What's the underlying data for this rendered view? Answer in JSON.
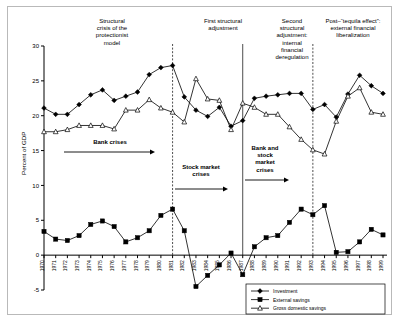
{
  "chart_data": {
    "type": "line",
    "title": "",
    "xlabel": "",
    "ylabel": "Percent of GDP",
    "ylim": [
      -5,
      30
    ],
    "yticks": [
      -5,
      0,
      5,
      10,
      15,
      20,
      25,
      30
    ],
    "ytick_labels": [
      "-5",
      "0",
      "5",
      "10",
      "15",
      "20",
      "25",
      "30"
    ],
    "grid": false,
    "legend_position": "bottom-right",
    "categories": [
      "1970",
      "1971",
      "1972",
      "1973",
      "1974",
      "1975",
      "1976",
      "1977",
      "1978",
      "1979",
      "1980",
      "1981",
      "1982",
      "1983",
      "1984",
      "1985",
      "1986",
      "1987",
      "1988",
      "1989",
      "1990",
      "1991",
      "1992",
      "1993",
      "1994",
      "1995",
      "1996",
      "1997",
      "1998",
      "1999"
    ],
    "series": [
      {
        "name": "Investment",
        "marker": "diamond",
        "values": [
          21.1,
          20.2,
          20.2,
          21.6,
          23.0,
          23.7,
          22.2,
          22.8,
          23.4,
          25.9,
          26.9,
          27.2,
          22.7,
          20.8,
          19.9,
          21.2,
          18.5,
          19.3,
          22.5,
          22.8,
          23.0,
          23.2,
          23.2,
          20.9,
          21.6,
          19.8,
          23.1,
          25.8,
          24.3,
          23.2
        ]
      },
      {
        "name": "External savings",
        "marker": "square",
        "values": [
          3.4,
          2.3,
          2.1,
          2.8,
          4.4,
          4.9,
          4.1,
          1.9,
          2.5,
          3.5,
          5.7,
          6.6,
          3.5,
          -4.5,
          -2.9,
          -1.4,
          0.3,
          -2.8,
          1.2,
          2.5,
          2.8,
          4.7,
          6.6,
          5.8,
          7.1,
          0.4,
          0.5,
          1.9,
          3.7,
          2.9
        ]
      },
      {
        "name": "Gross domestic savings",
        "marker": "triangle",
        "values": [
          17.7,
          17.7,
          18.0,
          18.6,
          18.6,
          18.6,
          18.1,
          20.8,
          20.8,
          22.3,
          21.1,
          20.5,
          19.1,
          25.3,
          22.4,
          22.2,
          18.0,
          21.8,
          21.2,
          20.2,
          20.2,
          18.4,
          16.6,
          15.1,
          14.5,
          19.2,
          22.8,
          24.0,
          20.5,
          20.2
        ]
      }
    ],
    "period_dividers": [
      {
        "after_year": "1981",
        "style": "dashed"
      },
      {
        "after_year": "1987",
        "style": "solid"
      },
      {
        "after_year": "1993",
        "style": "dashed"
      }
    ],
    "period_labels": [
      {
        "text": "Structural\ncrisis of the\nprotectionist\nmodel",
        "center_year": "1975"
      },
      {
        "text": "First structural\nadjustment",
        "center_year": "1984"
      },
      {
        "text": "Second\nstructural\nadjustment:\ninternal\nfinancial\nderegulation",
        "center_year": "1990"
      },
      {
        "text": "Post–“tequila effect”:\nexternal financial\nliberalization",
        "center_year": "1996"
      }
    ],
    "annotations": [
      {
        "text": "Bank crises",
        "bold": true,
        "arrow": "right"
      },
      {
        "text": "Stock market\ncrises",
        "bold": true,
        "arrow": "right"
      },
      {
        "text": "Bank and\nstock\nmarket\ncrises",
        "bold": true,
        "arrow": "right"
      }
    ]
  },
  "chart": {
    "y_axis_title": "Percent of GDP",
    "y_ticks": [
      "30",
      "25",
      "20",
      "15",
      "10",
      "5",
      "0",
      "-5"
    ],
    "x_ticks": [
      "1970",
      "1971",
      "1972",
      "1973",
      "1974",
      "1975",
      "1976",
      "1977",
      "1978",
      "1979",
      "1980",
      "1981",
      "1982",
      "1983",
      "1984",
      "1985",
      "1986",
      "1987",
      "1988",
      "1989",
      "1990",
      "1991",
      "1992",
      "1993",
      "1994",
      "1995",
      "1996",
      "1997",
      "1998",
      "1999"
    ],
    "legend": {
      "items": [
        {
          "label": "Investment"
        },
        {
          "label": "External savings"
        },
        {
          "label": "Gross domestic savings"
        }
      ]
    },
    "period_headers": {
      "p1_l1": "Structural",
      "p1_l2": "crisis of the",
      "p1_l3": "protectionist",
      "p1_l4": "model",
      "p2_l1": "First structural",
      "p2_l2": "adjustment",
      "p3_l1": "Second",
      "p3_l2": "structural",
      "p3_l3": "adjustment:",
      "p3_l4": "internal",
      "p3_l5": "financial",
      "p3_l6": "deregulation",
      "p4_l1": "Post–“tequila effect”:",
      "p4_l2": "external financial",
      "p4_l3": "liberalization"
    },
    "crisis_labels": {
      "bank_crises": "Bank crises",
      "stock_market_l1": "Stock market",
      "stock_market_l2": "crises",
      "bank_stock_l1": "Bank and",
      "bank_stock_l2": "stock",
      "bank_stock_l3": "market",
      "bank_stock_l4": "crises"
    }
  }
}
